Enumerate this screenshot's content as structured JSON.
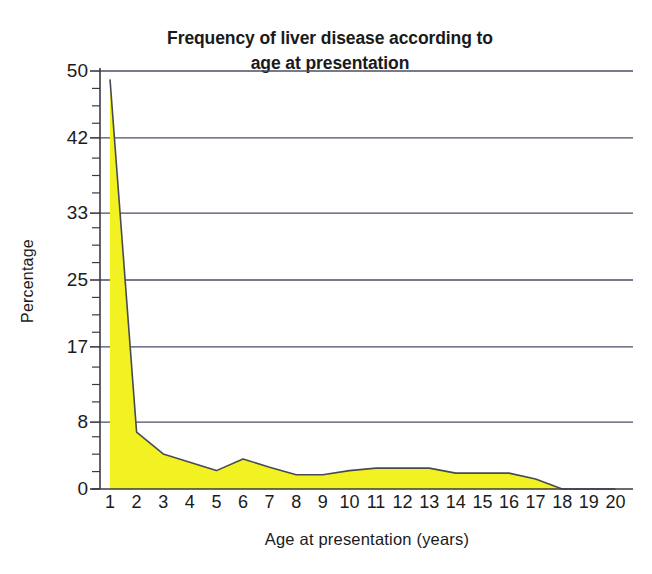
{
  "chart_data": {
    "type": "area",
    "title_line1": "Frequency of liver disease according to",
    "title_line2": "age at presentation",
    "xlabel": "Age at presentation (years)",
    "ylabel": "Percentage",
    "x": [
      1,
      2,
      3,
      4,
      5,
      6,
      7,
      8,
      9,
      10,
      11,
      12,
      13,
      14,
      15,
      16,
      17,
      18,
      19,
      20
    ],
    "categories": [
      "1",
      "2",
      "3",
      "4",
      "5",
      "6",
      "7",
      "8",
      "9",
      "10",
      "11",
      "12",
      "13",
      "14",
      "15",
      "16",
      "17",
      "18",
      "19",
      "20"
    ],
    "values": [
      49,
      6.8,
      4.2,
      3.2,
      2.2,
      3.6,
      2.6,
      1.7,
      1.7,
      2.2,
      2.5,
      2.5,
      2.5,
      1.9,
      1.9,
      1.9,
      1.2,
      0,
      0,
      0
    ],
    "series": [
      {
        "name": "Percentage",
        "values": [
          49,
          6.8,
          4.2,
          3.2,
          2.2,
          3.6,
          2.6,
          1.7,
          1.7,
          2.2,
          2.5,
          2.5,
          2.5,
          1.9,
          1.9,
          1.9,
          1.2,
          0,
          0,
          0
        ]
      }
    ],
    "ylim": [
      0,
      50
    ],
    "xlim": [
      1,
      20
    ],
    "ytick_values": [
      0,
      8,
      17,
      25,
      33,
      42,
      50
    ],
    "ytick_labels": [
      "0",
      "8",
      "17",
      "25",
      "33",
      "42",
      "50"
    ],
    "xtick_labels": [
      "1",
      "2",
      "3",
      "4",
      "5",
      "6",
      "7",
      "8",
      "9",
      "10",
      "11",
      "12",
      "13",
      "14",
      "15",
      "16",
      "17",
      "18",
      "19",
      "20"
    ],
    "y_minor_ticks": true,
    "grid": "horizontal",
    "legend": "none",
    "colors": {
      "area_fill": "#f2f222",
      "line": "#4a4a52",
      "grid": "#4c4c68",
      "axis": "#3a3a46",
      "text": "#1b1b1b",
      "background": "#ffffff"
    }
  }
}
